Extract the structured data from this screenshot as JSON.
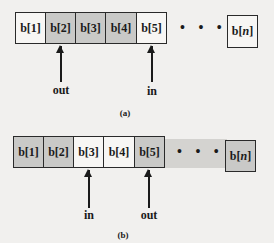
{
  "diagram_a": {
    "cells": [
      "b[1]",
      "b[2]",
      "b[3]",
      "b[4]",
      "b[5]"
    ],
    "shaded": [
      false,
      true,
      true,
      true,
      false
    ],
    "dots": "• • • •",
    "last_cell_prefix": "b[",
    "last_cell_var": "n",
    "last_cell_suffix": "]",
    "pointer_out": "out",
    "pointer_in": "in",
    "caption": "(a)"
  },
  "diagram_b": {
    "cells": [
      "b[1]",
      "b[2]",
      "b[3]",
      "b[4]",
      "b[5]"
    ],
    "shaded": [
      true,
      true,
      false,
      false,
      true
    ],
    "dots": "• • • •",
    "last_cell_prefix": "b[",
    "last_cell_var": "n",
    "last_cell_suffix": "]",
    "pointer_in": "in",
    "pointer_out": "out",
    "caption": "(b)"
  }
}
